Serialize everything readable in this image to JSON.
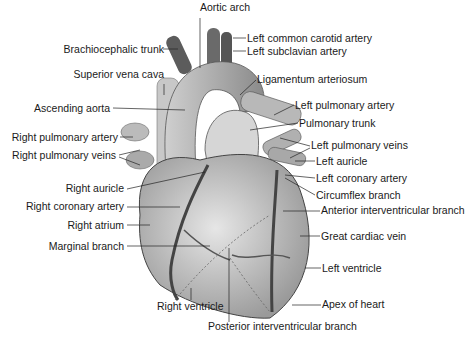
{
  "diagram": {
    "labels_left": [
      {
        "text": "Brachiocephalic trunk",
        "x": 168,
        "y": 49
      },
      {
        "text": "Superior vena cava",
        "x": 164,
        "y": 74
      },
      {
        "text": "Ascending aorta",
        "x": 110,
        "y": 107
      },
      {
        "text": "Right pulmonary artery",
        "x": 118,
        "y": 136
      },
      {
        "text": "Right pulmonary veins",
        "x": 116,
        "y": 155
      },
      {
        "text": "Right auricle",
        "x": 124,
        "y": 188
      },
      {
        "text": "Right coronary artery",
        "x": 124,
        "y": 206
      },
      {
        "text": "Right atrium",
        "x": 124,
        "y": 225
      },
      {
        "text": "Marginal branch",
        "x": 124,
        "y": 246
      }
    ],
    "labels_right": [
      {
        "text": "Left common carotid artery",
        "x": 247,
        "y": 38
      },
      {
        "text": "Left subclavian artery",
        "x": 247,
        "y": 51
      },
      {
        "text": "Ligamentum arteriosum",
        "x": 257,
        "y": 79
      },
      {
        "text": "Left pulmonary artery",
        "x": 295,
        "y": 105
      },
      {
        "text": "Pulmonary trunk",
        "x": 299,
        "y": 123
      },
      {
        "text": "Left pulmonary veins",
        "x": 311,
        "y": 145
      },
      {
        "text": "Left auricle",
        "x": 316,
        "y": 161
      },
      {
        "text": "Left coronary artery",
        "x": 316,
        "y": 178
      },
      {
        "text": "Circumflex branch",
        "x": 316,
        "y": 195
      },
      {
        "text": "Anterior interventricular branch",
        "x": 321,
        "y": 210
      },
      {
        "text": "Great cardiac vein",
        "x": 321,
        "y": 236
      },
      {
        "text": "Left ventricle",
        "x": 322,
        "y": 268
      },
      {
        "text": "Apex of heart",
        "x": 322,
        "y": 304
      }
    ],
    "labels_top": [
      {
        "text": "Aortic arch",
        "x": 200,
        "y": 7
      }
    ],
    "labels_bottom": [
      {
        "text": "Right ventricle",
        "x": 157,
        "y": 305
      },
      {
        "text": "Posterior interventricular branch",
        "x": 208,
        "y": 325
      }
    ]
  }
}
